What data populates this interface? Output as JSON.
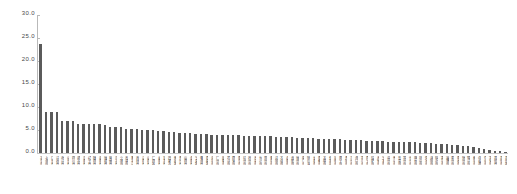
{
  "chart_data": {
    "type": "bar",
    "title": "",
    "xlabel": "",
    "ylabel": "",
    "ylim": [
      0.0,
      30.0
    ],
    "grid": false,
    "legend": false,
    "bar_color": "#5b5b5b",
    "axis_color": "#b9b9b9",
    "ytick_labels": [
      "30.0",
      "25.0",
      "20.0",
      "15.0",
      "10.0",
      "5.0",
      "0.0"
    ],
    "ytick_values": [
      30.0,
      25.0,
      20.0,
      15.0,
      10.0,
      5.0,
      0.0
    ],
    "categories": [
      "北京市",
      "上海市",
      "广东省",
      "江苏省",
      "浙江省",
      "山东省",
      "四川省",
      "湖北省",
      "河南省",
      "辽宁省",
      "陕西省",
      "湖南省",
      "福建省",
      "安徽省",
      "河北省",
      "重庆市",
      "天津市",
      "黑龙江",
      "吉林省",
      "江西省",
      "山西省",
      "广西区",
      "云南省",
      "甘肃省",
      "内蒙古",
      "新疆区",
      "贵州省",
      "山西省",
      "海南省",
      "宁夏区",
      "青海省",
      "西藏区",
      "深圳市",
      "广州市",
      "成都市",
      "武汉市",
      "西安市",
      "南京市",
      "杭州市",
      "苏州市",
      "天津市",
      "长沙市",
      "郑州市",
      "青岛市",
      "沈阳市",
      "大连市",
      "济南市",
      "合肥市",
      "福州市",
      "厦门市",
      "哈尔滨",
      "长春市",
      "南昌市",
      "太原市",
      "石家庄",
      "昆明市",
      "南宁市",
      "贵阳市",
      "兰州市",
      "海口市",
      "银川市",
      "西宁市",
      "拉萨市",
      "无锡市",
      "宁波市",
      "温州市",
      "佛山市",
      "东莞市",
      "常州市",
      "徐州市",
      "烟台市",
      "唐山市",
      "保定市",
      "洛阳市",
      "临沂市",
      "潍坊市",
      "淄博市",
      "泰州市",
      "南通市",
      "扬州市",
      "镇江市",
      "盐城市",
      "连云港",
      "宿迁市",
      "淮安市",
      "其他省",
      "其他市",
      "其他区"
    ],
    "values": [
      23.8,
      9.0,
      9.0,
      9.0,
      7.0,
      7.0,
      7.0,
      6.3,
      6.3,
      6.3,
      6.3,
      6.3,
      6.0,
      5.6,
      5.6,
      5.6,
      5.2,
      5.2,
      5.2,
      5.0,
      5.0,
      5.0,
      4.8,
      4.8,
      4.6,
      4.6,
      4.4,
      4.4,
      4.4,
      4.2,
      4.2,
      4.2,
      4.0,
      4.0,
      4.0,
      3.9,
      3.9,
      3.9,
      3.8,
      3.8,
      3.7,
      3.7,
      3.6,
      3.6,
      3.5,
      3.5,
      3.4,
      3.4,
      3.3,
      3.3,
      3.2,
      3.2,
      3.1,
      3.1,
      3.0,
      3.0,
      3.0,
      2.9,
      2.9,
      2.8,
      2.8,
      2.7,
      2.7,
      2.6,
      2.6,
      2.5,
      2.5,
      2.4,
      2.4,
      2.3,
      2.3,
      2.2,
      2.2,
      2.1,
      2.0,
      2.0,
      1.9,
      1.8,
      1.7,
      1.6,
      1.5,
      1.3,
      1.1,
      0.9,
      0.7,
      0.5,
      0.4,
      0.3
    ]
  }
}
